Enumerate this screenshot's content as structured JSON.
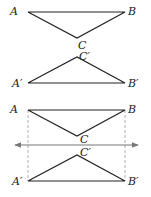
{
  "figure_1": {
    "description": "Triangle ABC with apex C below AB, and its reflection A'B'C' with apex C' above A'B'",
    "triangle_top": {
      "labels": {
        "A": "A",
        "B": "B",
        "C": "C"
      },
      "points": {
        "A": [
          28,
          12
        ],
        "B": [
          125,
          12
        ],
        "C": [
          77,
          38
        ]
      }
    },
    "triangle_bottom": {
      "labels": {
        "A": "A′",
        "B": "B′",
        "C": "C′"
      },
      "points": {
        "A": [
          28,
          83
        ],
        "B": [
          125,
          83
        ],
        "C": [
          77,
          57
        ]
      }
    }
  },
  "figure_2": {
    "description": "Same two triangles with a horizontal line of reflection and dashed vertical connectors",
    "triangle_top": {
      "labels": {
        "A": "A",
        "B": "B",
        "C": "C"
      },
      "points": {
        "A": [
          28,
          110
        ],
        "B": [
          125,
          110
        ],
        "C": [
          77,
          136
        ]
      }
    },
    "triangle_bottom": {
      "labels": {
        "A": "A′",
        "B": "B′",
        "C": "C′"
      },
      "points": {
        "A": [
          28,
          181
        ],
        "B": [
          125,
          181
        ],
        "C": [
          77,
          155
        ]
      }
    },
    "reflection_line": {
      "y": 145,
      "x_start": 14,
      "x_end": 139,
      "color": "#666666"
    },
    "dashed_lines": [
      {
        "x": 28,
        "y1": 110,
        "y2": 181
      },
      {
        "x": 125,
        "y1": 110,
        "y2": 181
      }
    ]
  },
  "colors": {
    "stroke": "#222222",
    "axis": "#777777",
    "dashed": "#999999"
  }
}
